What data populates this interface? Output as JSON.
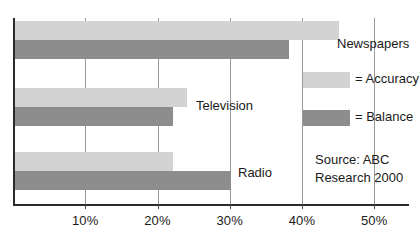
{
  "chart_data": {
    "type": "bar",
    "orientation": "horizontal",
    "title": "",
    "xlabel": "",
    "ylabel": "",
    "categories": [
      "Newspapers",
      "Television",
      "Radio"
    ],
    "series": [
      {
        "name": "Accuracy",
        "legend_label": "= Accuracy",
        "color": "#d3d3d3",
        "values": [
          45,
          24,
          22
        ]
      },
      {
        "name": "Balance",
        "legend_label": "= Balance",
        "color": "#8d8d8d",
        "values": [
          38,
          22,
          30
        ]
      }
    ],
    "xlim": [
      0,
      55
    ],
    "xticks": [
      10,
      20,
      30,
      40,
      50
    ],
    "xtick_labels": [
      "10%",
      "20%",
      "30%",
      "40%",
      "50%"
    ],
    "grid": true,
    "grid_axis": "x",
    "legend_position": "right",
    "annotations": {
      "source_line_1": "Source: ABC",
      "source_line_2": "Research 2000"
    }
  },
  "axis": {
    "line_color": "#2b2b2b",
    "grid_color": "#9a9a9a"
  }
}
